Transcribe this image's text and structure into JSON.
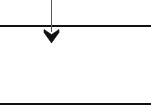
{
  "canvas": {
    "width": 151,
    "height": 112,
    "background_color": "#ffffff"
  },
  "diagram": {
    "type": "flow-arrow-between-rules",
    "title": "",
    "stroke_color": "#1a1a1a",
    "rule_color": "#111111",
    "shaft_color": "#555555",
    "elements": [
      {
        "name": "top-rule",
        "kind": "horizontal-line",
        "x1": 0,
        "y1": 25.5,
        "x2": 151,
        "y2": 25.5,
        "thickness": 2,
        "color": "#111111",
        "label": ""
      },
      {
        "name": "bottom-rule",
        "kind": "horizontal-line",
        "x1": 0,
        "y1": 103.5,
        "x2": 151,
        "y2": 103.5,
        "thickness": 2,
        "color": "#111111",
        "label": ""
      },
      {
        "name": "down-arrow",
        "kind": "arrow",
        "direction": "down",
        "shaft_x": 51.5,
        "shaft_y_start": 0,
        "shaft_y_end": 31,
        "shaft_thickness": 1.6,
        "shaft_color": "#5a5a5a",
        "head_tip_x": 51.5,
        "head_tip_y": 43,
        "head_left_x": 44,
        "head_right_x": 59,
        "head_top_y": 29.5,
        "head_notch_y": 34,
        "head_color": "#111111",
        "label": ""
      }
    ]
  },
  "accessibility": {
    "figure_description": "Two horizontal rules with a vertical downward arrow crossing the upper rule"
  }
}
